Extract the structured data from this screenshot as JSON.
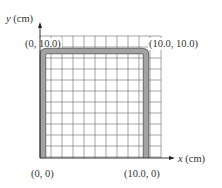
{
  "figure": {
    "axes": {
      "x_label_var": "x",
      "x_label_unit": " (cm)",
      "y_label_var": "y",
      "y_label_unit": " (cm)"
    },
    "points": {
      "origin": "(0, 0)",
      "bottom_right": "(10.0, 0)",
      "top_left": "(0, 10.0)",
      "top_right": "(10.0, 10.0)"
    },
    "grid": {
      "columns": 10,
      "rows": 10,
      "extra_cells": 1,
      "line_color": "#555555"
    },
    "shape": {
      "description": "U-shaped rod along left, top, and right edges",
      "fill_color": "#9a9a9a",
      "edge_color": "#6e6e6e"
    }
  }
}
